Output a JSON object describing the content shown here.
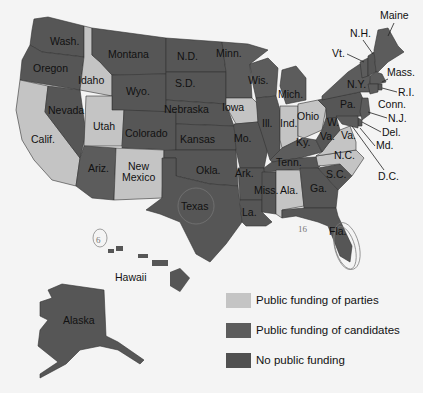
{
  "colors": {
    "parties": "#c4c4c4",
    "candidates": "#5c5c5c",
    "none": "#565656",
    "background": "#f4f4f4"
  },
  "legend": [
    {
      "key": "parties",
      "label": "Public funding of parties"
    },
    {
      "key": "candidates",
      "label": "Public funding of candidates"
    },
    {
      "key": "none",
      "label": "No public funding"
    }
  ],
  "states": {
    "wash": "Wash.",
    "oregon": "Oregon",
    "calif": "Calif.",
    "idaho": "Idaho",
    "nevada": "Nevada",
    "montana": "Montana",
    "wyo": "Wyo.",
    "utah": "Utah",
    "ariz": "Ariz.",
    "colorado": "Colorado",
    "new_mexico_1": "New",
    "new_mexico_2": "Mexico",
    "nd": "N.D.",
    "sd": "S.D.",
    "nebraska": "Nebraska",
    "kansas": "Kansas",
    "okla": "Okla.",
    "texas": "Texas",
    "minn": "Minn.",
    "iowa": "Iowa",
    "mo": "Mo.",
    "ark": "Ark.",
    "la": "La.",
    "wis": "Wis.",
    "ill": "Ill.",
    "mich": "Mich.",
    "ind": "Ind.",
    "ohio": "Ohio",
    "ky": "Ky.",
    "tenn": "Tenn.",
    "miss": "Miss.",
    "ala": "Ala.",
    "ga": "Ga.",
    "fla": "Fla.",
    "sc": "S.C.",
    "nc": "N.C.",
    "va": "Va.",
    "wva_1": "W.",
    "wva_2": "Va.",
    "pa": "Pa.",
    "ny": "N.Y.",
    "maine": "Maine",
    "nh": "N.H.",
    "vt": "Vt.",
    "mass": "Mass.",
    "ri": "R.I.",
    "conn": "Conn.",
    "nj": "N.J.",
    "del": "Del.",
    "md": "Md.",
    "dc": "D.C.",
    "hawaii": "Hawaii",
    "alaska": "Alaska"
  },
  "annotations": {
    "hawaii_number": "6",
    "florida_number": "16"
  }
}
